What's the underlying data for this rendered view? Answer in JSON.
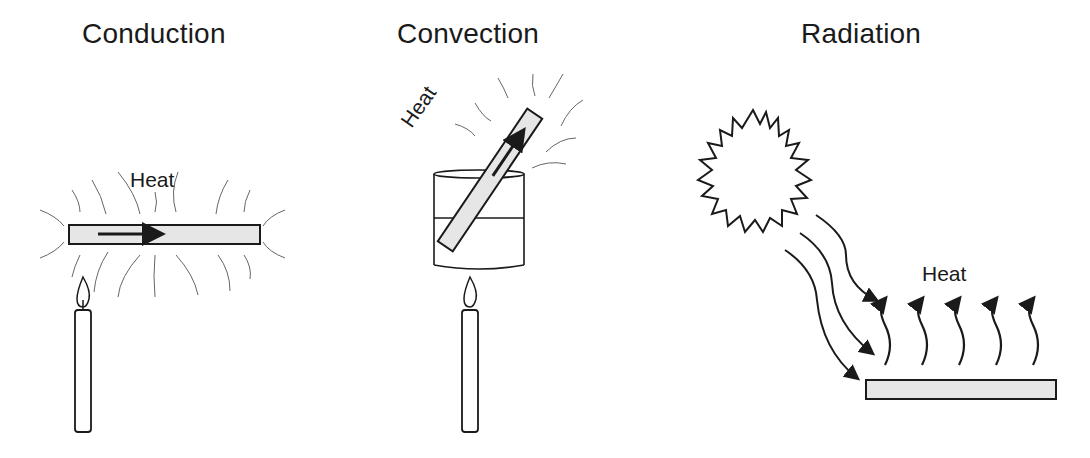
{
  "panels": [
    {
      "title": "Conduction",
      "heat_label": "Heat"
    },
    {
      "title": "Convection",
      "heat_label": "Heat"
    },
    {
      "title": "Radiation",
      "heat_label": "Heat"
    }
  ],
  "colors": {
    "stroke": "#1a1a1a",
    "bar_fill": "#e6e6e6",
    "wave": "#555555"
  }
}
